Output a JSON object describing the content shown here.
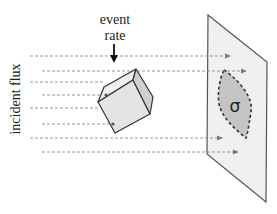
{
  "diagram": {
    "labels": {
      "event_line1": "event",
      "event_line2": "rate",
      "incident_flux": "incident flux",
      "cross_section": "σ"
    },
    "colors": {
      "background": "#ffffff",
      "flux_arrow": "#8a8a8a",
      "cube_front": "#e6e6e6",
      "cube_side": "#cfcfcf",
      "cube_top": "#efefef",
      "cube_edge": "#333333",
      "plane_fill": "#f0f0f0",
      "plane_edge": "#555555",
      "sigma_fill": "#c4c4c4",
      "sigma_edge": "#333333",
      "text": "#222222"
    },
    "elements": [
      {
        "type": "label",
        "name": "event-rate-label",
        "text": "event rate"
      },
      {
        "type": "arrow",
        "name": "event-rate-arrow",
        "direction": "down"
      },
      {
        "type": "label",
        "name": "incident-flux-label",
        "text": "incident flux",
        "orientation": "vertical"
      },
      {
        "type": "flux_lines",
        "name": "incident-flux-arrows",
        "count": 8,
        "style": "dashed"
      },
      {
        "type": "shape",
        "name": "target-cube"
      },
      {
        "type": "shape",
        "name": "detector-plane"
      },
      {
        "type": "shape",
        "name": "cross-section-region",
        "label": "σ"
      }
    ]
  }
}
